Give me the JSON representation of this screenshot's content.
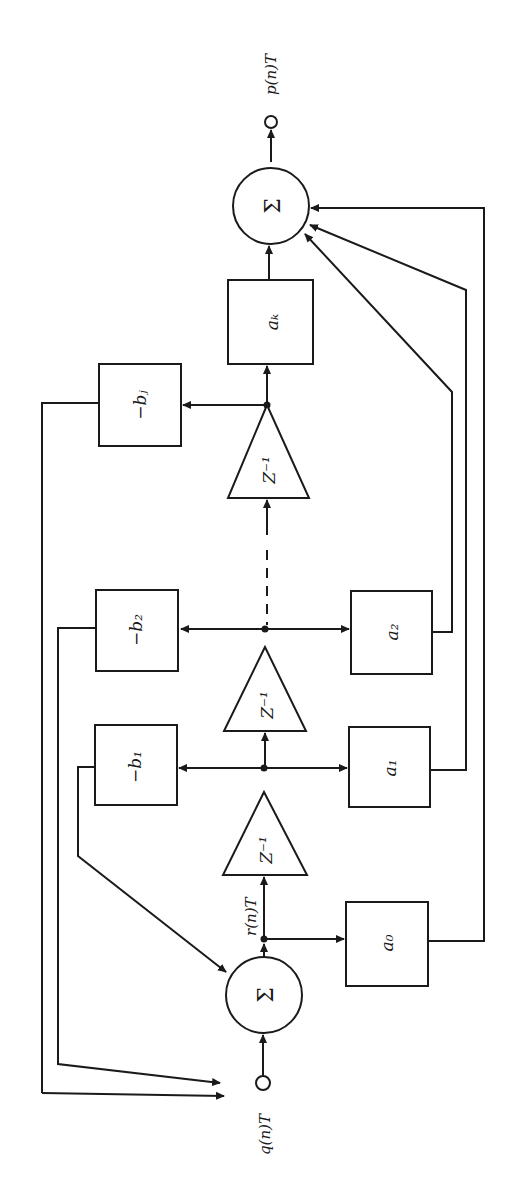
{
  "diagram": {
    "type": "IIR digital filter block diagram (rotated 90°)",
    "input_label": "q(n)T",
    "output_label": "p(n)T",
    "internal_signal_label": "r(n)T",
    "sum_symbol": "Σ",
    "delay_label": "Z⁻¹",
    "feedforward": [
      "a₀",
      "a₁",
      "a₂",
      "aₖ"
    ],
    "feedback": [
      "−b₁",
      "−b₂",
      "−bⱼ"
    ],
    "ink_color": "#1a1a1a",
    "background_color": "#ffffff"
  }
}
